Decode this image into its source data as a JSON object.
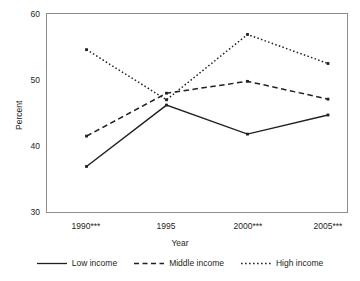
{
  "chart_data": {
    "type": "line",
    "title": "",
    "xlabel": "Year",
    "ylabel": "Percent",
    "categories": [
      "1990***",
      "1995",
      "2000***",
      "2005***"
    ],
    "x_tick_labels": [
      "1990***",
      "1995",
      "2000***",
      "2005***"
    ],
    "y_tick_labels": [
      "30",
      "40",
      "50",
      "60"
    ],
    "y_ticks": [
      30,
      40,
      50,
      60
    ],
    "ylim": [
      30,
      60
    ],
    "grid": false,
    "legend_position": "bottom",
    "series": [
      {
        "name": "Low income",
        "style": "solid",
        "color": "#231f20",
        "marker": "square",
        "values": [
          36.9,
          46.2,
          41.8,
          44.7
        ]
      },
      {
        "name": "Middle income",
        "style": "dashed",
        "color": "#231f20",
        "marker": "square",
        "values": [
          41.5,
          48.0,
          49.8,
          47.1
        ]
      },
      {
        "name": "High income",
        "style": "dotted",
        "color": "#231f20",
        "marker": "square",
        "values": [
          54.6,
          47.0,
          56.9,
          52.5
        ]
      }
    ]
  },
  "axis": {
    "y_label": "Percent",
    "x_label": "Year",
    "y_tick_0": "30",
    "y_tick_1": "40",
    "y_tick_2": "50",
    "y_tick_3": "60",
    "x_tick_0": "1990***",
    "x_tick_1": "1995",
    "x_tick_2": "2000***",
    "x_tick_3": "2005***"
  },
  "legend": {
    "items": [
      {
        "label": "Low income"
      },
      {
        "label": "Middle income"
      },
      {
        "label": "High income"
      }
    ]
  },
  "colors": {
    "ink": "#231f20",
    "frame": "#8d8d8d",
    "background": "#ffffff"
  }
}
